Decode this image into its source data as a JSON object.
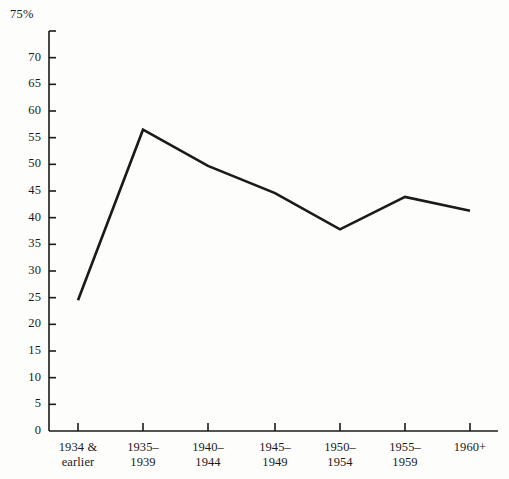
{
  "chart_data": {
    "type": "line",
    "title": "",
    "subtitle": "",
    "xlabel": "",
    "ylabel": "",
    "y_unit_label": "75%",
    "categories": [
      "1934 & earlier",
      "1935–1939",
      "1940–1944",
      "1945–1949",
      "1950–1954",
      "1955–1959",
      "1960+"
    ],
    "category_lines": [
      [
        "1934 &",
        "earlier"
      ],
      [
        "1935–",
        "1939"
      ],
      [
        "1940–",
        "1944"
      ],
      [
        "1945–",
        "1949"
      ],
      [
        "1950–",
        "1954"
      ],
      [
        "1955–",
        "1959"
      ],
      [
        "1960+",
        ""
      ]
    ],
    "values": [
      24.5,
      56.5,
      49.7,
      44.6,
      37.8,
      43.9,
      41.3
    ],
    "ylim": [
      0,
      75
    ],
    "ytick_step": 5,
    "ytick_labels": [
      "75%",
      "70",
      "65",
      "60",
      "55",
      "50",
      "45",
      "40",
      "35",
      "30",
      "25",
      "20",
      "15",
      "10",
      "5",
      "0"
    ],
    "ytick_values": [
      75,
      70,
      65,
      60,
      55,
      50,
      45,
      40,
      35,
      30,
      25,
      20,
      15,
      10,
      5,
      0
    ],
    "grid": false,
    "legend": "none",
    "line_color": "#1a1a1a",
    "axis_color": "#1a1a1a",
    "background_color": "#fdfdfb"
  }
}
